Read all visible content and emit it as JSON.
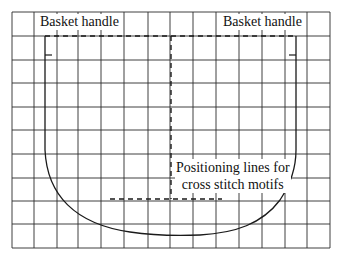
{
  "figure": {
    "width": 340,
    "height": 261,
    "background": "#ffffff",
    "line_color": "#1a1a1a",
    "grid_color": "#2a2a2a"
  },
  "grid": {
    "vertical_lines_x": [
      12,
      34,
      57,
      78,
      101,
      124,
      148,
      170,
      193,
      216,
      239,
      262,
      285,
      307,
      330
    ],
    "horizontal_lines_y": [
      12,
      36,
      60,
      83,
      107,
      130,
      154,
      178,
      201,
      224,
      248
    ],
    "columns": 14,
    "rows": 10
  },
  "labels": {
    "basket_handle_left": "Basket handle",
    "basket_handle_right": "Basket handle",
    "positioning_line1": "Positioning lines for",
    "positioning_line2": "cross stitch motifs"
  },
  "shapes": {
    "basket_outline": "solid U-shaped basket outline",
    "handle_line": "dashed horizontal line along top edge",
    "center_line": "dashed vertical center line",
    "motif_line": "dashed horizontal positioning line"
  }
}
